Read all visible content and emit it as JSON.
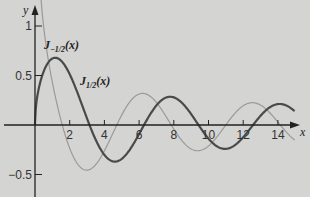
{
  "chart_data": {
    "type": "line",
    "title": "",
    "xlabel": "x",
    "ylabel": "y",
    "xlim": [
      0,
      15.2
    ],
    "ylim": [
      -0.72,
      1.0
    ],
    "grid": false,
    "x_ticks": [
      2,
      4,
      6,
      8,
      10,
      12,
      14
    ],
    "x_tick_labels": [
      "2",
      "4",
      "6",
      "8",
      "10",
      "12",
      "14"
    ],
    "y_ticks": [
      1,
      0.5,
      -0.5
    ],
    "y_tick_labels": [
      "1",
      "0.5",
      "-0.5"
    ],
    "series": [
      {
        "name": "J_{-1/2}(x)",
        "label_main": "J",
        "label_sub": "-1/2",
        "label_arg": "(x)",
        "formula": "sqrt(2/(pi x)) cos x",
        "color": "#9a9a9a",
        "width": 1.2,
        "x": [
          0.5,
          1,
          1.5,
          2,
          3,
          4,
          4.71,
          5,
          6,
          7,
          7.85,
          8,
          9,
          10,
          11,
          12,
          13,
          14,
          15
        ],
        "y": [
          0.99,
          0.43,
          0.05,
          -0.24,
          -0.46,
          -0.26,
          0.0,
          0.1,
          0.31,
          0.23,
          0.0,
          -0.04,
          -0.24,
          -0.21,
          0.01,
          0.2,
          0.2,
          0.03,
          -0.16
        ]
      },
      {
        "name": "J_{1/2}(x)",
        "label_main": "J",
        "label_sub": "1/2",
        "label_arg": "(x)",
        "formula": "sqrt(2/(pi x)) sin x",
        "color": "#4a4a4a",
        "width": 2.2,
        "x": [
          0,
          0.5,
          1,
          1.5,
          2,
          3,
          3.14,
          4,
          4.6,
          5,
          6,
          6.28,
          7,
          7.8,
          8,
          9,
          9.42,
          10,
          11,
          12,
          12.57,
          13,
          14,
          15
        ],
        "y": [
          0,
          0.54,
          0.67,
          0.65,
          0.51,
          0.07,
          0.0,
          -0.3,
          -0.39,
          -0.34,
          -0.09,
          0.0,
          0.2,
          0.28,
          0.28,
          0.11,
          0.0,
          -0.14,
          -0.24,
          -0.12,
          0.0,
          0.09,
          0.21,
          0.13
        ]
      }
    ],
    "annotations": [
      {
        "text": "J_{-1/2}(x)",
        "x": 0.6,
        "y": 0.83
      },
      {
        "text": "J_{1/2}(x)",
        "x": 2.6,
        "y": 0.44
      }
    ],
    "legend": "inline labels"
  }
}
